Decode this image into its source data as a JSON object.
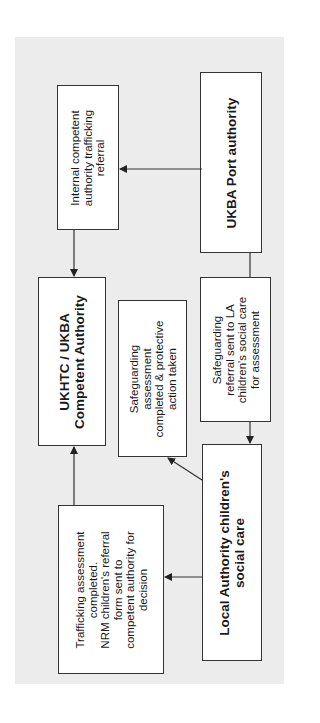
{
  "diagram": {
    "background_color": "#ececec",
    "orientation": "rotated -90deg (text reads bottom-to-top)",
    "nodes": {
      "port_authority": {
        "lines": [
          "UKBA Port authority"
        ]
      },
      "internal_referral": {
        "lines": [
          "Internal competent",
          "authority trafficking",
          "referral"
        ]
      },
      "competent_authority": {
        "lines": [
          "UKHTC / UKBA",
          "Competent Authority"
        ]
      },
      "safeguarding_referral": {
        "lines": [
          "Safeguarding",
          "referral sent to LA",
          "children's social care",
          "for assessment"
        ]
      },
      "safeguarding_assessment": {
        "lines": [
          "Safeguarding",
          "assessment",
          "completed & protective",
          "action taken"
        ]
      },
      "local_authority": {
        "lines": [
          "Local Authority children's",
          "social care"
        ]
      },
      "trafficking_assessment": {
        "lines": [
          "Trafficking assessment",
          "completed.",
          "NRM children's referral",
          "form sent to",
          "competent authority for",
          "decision"
        ]
      }
    },
    "edges": [
      {
        "from": "port_authority",
        "to": "internal_referral"
      },
      {
        "from": "internal_referral",
        "to": "competent_authority"
      },
      {
        "from": "port_authority",
        "to": "safeguarding_referral"
      },
      {
        "from": "safeguarding_referral",
        "to": "local_authority"
      },
      {
        "from": "local_authority",
        "to": "safeguarding_assessment"
      },
      {
        "from": "local_authority",
        "to": "trafficking_assessment"
      },
      {
        "from": "trafficking_assessment",
        "to": "competent_authority"
      }
    ]
  }
}
